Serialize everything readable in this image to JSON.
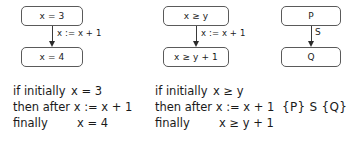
{
  "figure": {
    "background_color": "#ffffff",
    "ink_color": "#1a1a1a",
    "box_border_color": "#5a5a5a",
    "arrow_color": "#2b2b2b"
  },
  "diagrams": [
    {
      "id": "concrete-assignment-example",
      "precondition": "x = 3",
      "statement": "x := x + 1",
      "postcondition": "x = 4"
    },
    {
      "id": "symbolic-assignment-example",
      "precondition": "x ≥ y",
      "statement": "x := x + 1",
      "postcondition": "x ≥ y + 1"
    },
    {
      "id": "general-hoare-triple",
      "precondition": "P",
      "statement": "S",
      "postcondition": "Q"
    }
  ],
  "captions": [
    {
      "id": "caption-concrete",
      "lines": [
        {
          "lead": "if initially",
          "expr": "x = 3"
        },
        {
          "lead": "then after",
          "expr": "x := x + 1"
        },
        {
          "lead": "finally",
          "expr": "x = 4"
        }
      ]
    },
    {
      "id": "caption-symbolic",
      "lines": [
        {
          "lead": "if initially",
          "expr": "x ≥ y"
        },
        {
          "lead": "then after",
          "expr": "x := x + 1"
        },
        {
          "lead": "finally",
          "expr": "x ≥ y + 1"
        }
      ]
    },
    {
      "id": "caption-triple",
      "triple": "{P} S {Q}"
    }
  ]
}
